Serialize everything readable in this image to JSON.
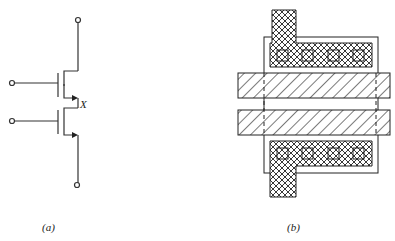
{
  "figure": {
    "panel_a": {
      "label": "(a)",
      "node_label": "X",
      "description": "Two series-connected NMOS transistors"
    },
    "panel_b": {
      "label": "(b)",
      "description": "Layout of two series transistors sharing diffusion"
    }
  },
  "colors": {
    "ink": "#222222",
    "background": "#ffffff"
  }
}
